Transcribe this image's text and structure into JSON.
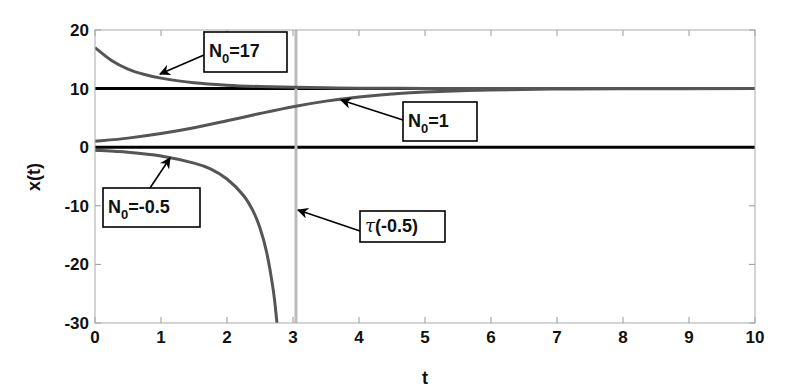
{
  "chart_data": {
    "type": "line",
    "title": "",
    "xlabel": "t",
    "ylabel": "x(t)",
    "xlim": [
      0,
      10
    ],
    "ylim": [
      -30,
      20
    ],
    "xticks": [
      0,
      1,
      2,
      3,
      4,
      5,
      6,
      7,
      8,
      9,
      10
    ],
    "yticks": [
      -30,
      -20,
      -10,
      0,
      10,
      20
    ],
    "grid": false,
    "legend": "none",
    "horizontal_lines": [
      {
        "y": 10,
        "color": "#000000"
      },
      {
        "y": 0,
        "color": "#000000"
      }
    ],
    "vertical_lines": [
      {
        "x": 3.045,
        "color": "#bbbbbb",
        "name": "tau(-0.5)"
      }
    ],
    "series": [
      {
        "name": "N0=17",
        "color": "#555555",
        "x": [
          0,
          0.25,
          0.5,
          0.75,
          1,
          1.5,
          2,
          2.5,
          3,
          3.5,
          4,
          5,
          6,
          8,
          10
        ],
        "y": [
          17,
          14.8,
          13.33,
          12.4,
          11.79,
          11.01,
          10.59,
          10.35,
          10.21,
          10.13,
          10.08,
          10.03,
          10.01,
          10.0,
          10.0
        ]
      },
      {
        "name": "N0=1",
        "color": "#555555",
        "x": [
          0,
          0.5,
          1,
          1.5,
          2,
          2.5,
          3,
          3.5,
          4,
          4.5,
          5,
          6,
          7,
          8,
          10
        ],
        "y": [
          1,
          1.55,
          2.32,
          3.32,
          4.51,
          5.75,
          6.91,
          7.86,
          8.58,
          9.09,
          9.43,
          9.78,
          9.92,
          9.97,
          10.0
        ]
      },
      {
        "name": "N0=-0.5",
        "color": "#555555",
        "x": [
          0,
          0.5,
          1,
          1.5,
          1.75,
          2,
          2.25,
          2.4,
          2.5,
          2.6,
          2.7,
          2.75,
          2.77
        ],
        "y": [
          -0.5,
          -0.85,
          -1.49,
          -2.71,
          -3.7,
          -5.43,
          -8.24,
          -11.0,
          -13.8,
          -17.9,
          -24.3,
          -29.2,
          -31.6
        ]
      }
    ],
    "annotations": [
      {
        "id": "n17",
        "main": "N",
        "sub": "0",
        "rest": "=17",
        "box": [
          204,
          32,
          83,
          40
        ],
        "arrow_from": [
          204,
          55
        ],
        "arrow_to": [
          160,
          74
        ]
      },
      {
        "id": "n1",
        "main": "N",
        "sub": "0",
        "rest": "=1",
        "box": [
          403,
          102,
          74,
          39
        ],
        "arrow_from": [
          403,
          120
        ],
        "arrow_to": [
          341,
          100
        ]
      },
      {
        "id": "nneg",
        "main": "N",
        "sub": "0",
        "rest": "=-0.5",
        "box": [
          103,
          188,
          97,
          39
        ],
        "arrow_from": [
          150,
          188
        ],
        "arrow_to": [
          170,
          158
        ]
      },
      {
        "id": "tau",
        "main": "τ",
        "sub": "",
        "rest": "(-0.5)",
        "box": [
          360,
          211,
          85,
          31
        ],
        "arrow_from": [
          360,
          231
        ],
        "arrow_to": [
          298,
          210
        ]
      }
    ]
  }
}
